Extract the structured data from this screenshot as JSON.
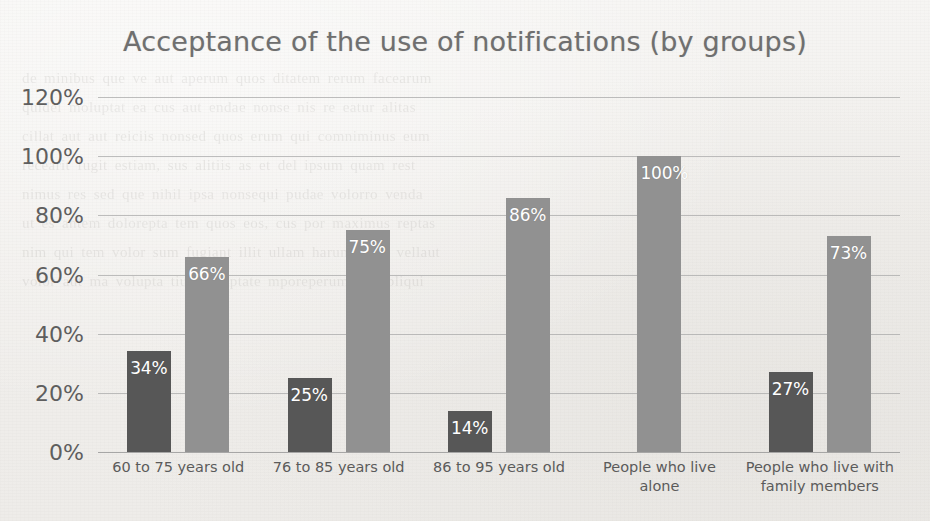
{
  "chart_data": {
    "type": "bar",
    "title": "Acceptance of the use of notifications (by groups)",
    "xlabel": "",
    "ylabel": "",
    "ylim": [
      0,
      120
    ],
    "ytick_labels": [
      "120%",
      "100%",
      "80%",
      "60%",
      "40%",
      "20%",
      "0%"
    ],
    "ytick_values": [
      120,
      100,
      80,
      60,
      40,
      20,
      0
    ],
    "grid": true,
    "legend": "none",
    "categories": [
      "60 to 75 years old",
      "76 to 85 years old",
      "86 to 95 years old",
      "People who live alone",
      "People who live with family members"
    ],
    "series": [
      {
        "name": "dark",
        "color": "#575757",
        "values": [
          34,
          25,
          14,
          null,
          27
        ],
        "labels": [
          "34%",
          "25%",
          "14%",
          "",
          "27%"
        ]
      },
      {
        "name": "light",
        "color": "#919191",
        "values": [
          66,
          75,
          86,
          100,
          73
        ],
        "labels": [
          "66%",
          "75%",
          "86%",
          "100%",
          "73%"
        ]
      }
    ]
  },
  "bleed_lines": [
    "de minibus que ve aut aperum quos ditatem rerum facearum",
    "quidel moluptat ea cus aut endae nonse nis re eatur alitas",
    "cillat aut aut reiciis nonsed quos erum qui comniminus eum",
    "recearit fugit estiam, sus alitiis as et del ipsum quam rest",
    "nimus res sed que nihil ipsa nonsequi pudae volorro venda",
    "",
    "ut es antem dolorepta tem quos eos, cus por maximus reptas",
    "",
    "nim qui tem volor sum fugiant illit ullam harum quae vellaut",
    "",
    "volor aut ma volupta tiuscil luptate mporeperum non pliqui"
  ]
}
